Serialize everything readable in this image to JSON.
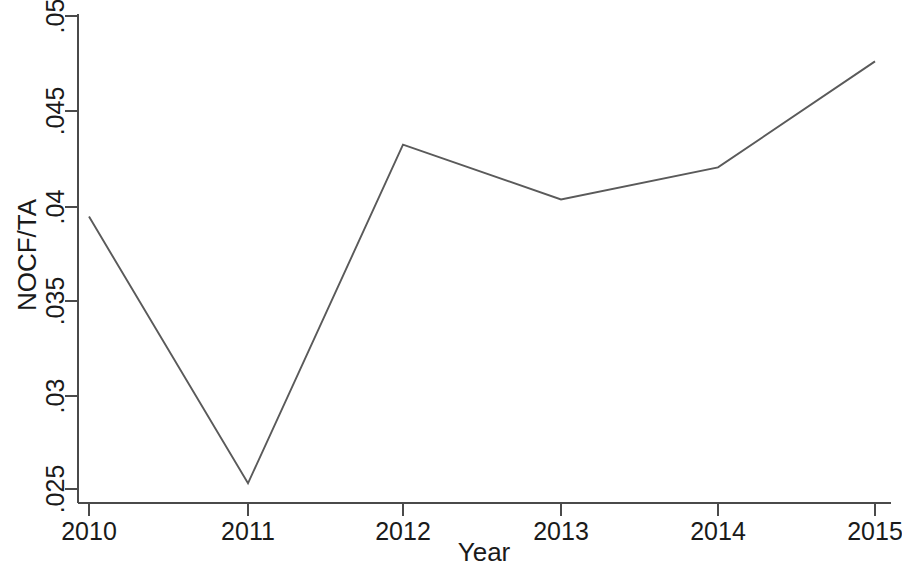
{
  "chart_data": {
    "type": "line",
    "title": "",
    "xlabel": "Year",
    "ylabel": "NOCF/TA",
    "categories": [
      "2010",
      "2011",
      "2012",
      "2013",
      "2014",
      "2015"
    ],
    "x": [
      2010,
      2011,
      2012,
      2013,
      2014,
      2015
    ],
    "values": [
      0.0394,
      0.0253,
      0.0432,
      0.0403,
      0.042,
      0.0476
    ],
    "series": [
      {
        "name": "NOCF/TA",
        "values": [
          0.0394,
          0.0253,
          0.0432,
          0.0403,
          0.042,
          0.0476
        ]
      }
    ],
    "xlim": [
      2010,
      2015
    ],
    "ylim": [
      0.025,
      0.05
    ],
    "xticks": [
      "2010",
      "2011",
      "2012",
      "2013",
      "2014",
      "2015"
    ],
    "yticks": [
      ".025",
      ".03",
      ".035",
      ".04",
      ".045",
      ".05"
    ],
    "ytick_values": [
      0.025,
      0.03,
      0.035,
      0.04,
      0.045,
      0.05
    ],
    "grid": false,
    "legend": false,
    "legend_position": "none",
    "line_color": "#5a5a5a",
    "axis_color": "#4a4a4a",
    "background_color": "#ffffff"
  },
  "axes": {
    "y_title": "NOCF/TA",
    "x_title": "Year"
  },
  "y_labels": [
    {
      "text": ".05",
      "y": 16
    },
    {
      "text": ".045",
      "y": 111
    },
    {
      "text": ".04",
      "y": 207
    },
    {
      "text": ".035",
      "y": 301
    },
    {
      "text": ".03",
      "y": 396
    },
    {
      "text": ".025",
      "y": 489
    }
  ],
  "x_labels": [
    {
      "text": "2010",
      "x": 89
    },
    {
      "text": "2011",
      "x": 248
    },
    {
      "text": "2012",
      "x": 403
    },
    {
      "text": "2013",
      "x": 561
    },
    {
      "text": "2014",
      "x": 718
    },
    {
      "text": "2015",
      "x": 875
    }
  ]
}
